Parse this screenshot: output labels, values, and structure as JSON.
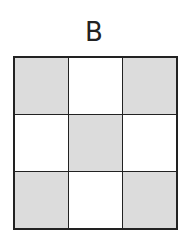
{
  "label": "B",
  "grid": {
    "rows": 3,
    "cols": 3,
    "colors": {
      "shaded": "#dcdcdc",
      "empty": "#ffffff",
      "line": "#222222"
    },
    "cells": [
      [
        "shaded",
        "empty",
        "shaded"
      ],
      [
        "empty",
        "shaded",
        "empty"
      ],
      [
        "shaded",
        "empty",
        "shaded"
      ]
    ]
  }
}
